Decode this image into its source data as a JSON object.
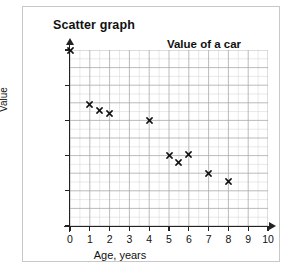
{
  "panel": {
    "heading": "Scatter graph"
  },
  "chart_data": {
    "type": "scatter",
    "title": "Value of a car",
    "xlabel": "Age, years",
    "ylabel": "Value",
    "xlim": [
      0,
      10
    ],
    "ylim": [
      0,
      10000
    ],
    "grid": true,
    "major_gridlines": {
      "x": 1,
      "y": 1000
    },
    "minor_gridlines": {
      "x": 0.5,
      "y": 500
    },
    "legend": null,
    "xticks": [
      "0",
      "1",
      "2",
      "3",
      "4",
      "5",
      "6",
      "7",
      "8",
      "9",
      "10"
    ],
    "xtick_values": [
      0,
      1,
      2,
      3,
      4,
      5,
      6,
      7,
      8,
      9,
      10
    ],
    "yticks": [
      "£0",
      "£2000",
      "£4000",
      "£6000",
      "£8000",
      "£10000"
    ],
    "ytick_values": [
      0,
      2000,
      4000,
      6000,
      8000,
      10000
    ],
    "marker": "x",
    "marker_color": "#111111",
    "points": [
      {
        "x": 0,
        "y": 10000
      },
      {
        "x": 1,
        "y": 6900
      },
      {
        "x": 1.5,
        "y": 6550
      },
      {
        "x": 2,
        "y": 6400
      },
      {
        "x": 4,
        "y": 6000
      },
      {
        "x": 5,
        "y": 4000
      },
      {
        "x": 5.5,
        "y": 3600
      },
      {
        "x": 6,
        "y": 4050
      },
      {
        "x": 7,
        "y": 3000
      },
      {
        "x": 8,
        "y": 2550
      }
    ]
  }
}
